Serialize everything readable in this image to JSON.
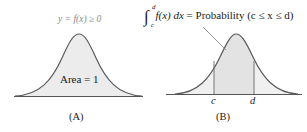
{
  "panel_a": {
    "title": "y = f(x) ≥ 0",
    "area_label": "Area = 1",
    "caption": "(A)"
  },
  "panel_b": {
    "integral_symbol": "∫",
    "upper_limit": "d",
    "lower_limit": "c",
    "integrand": "f(x) dx",
    "equals_text": "= Probability (c ≤ x ≤ d)",
    "c_label": "c",
    "d_label": "d",
    "caption": "(B)"
  },
  "colors": {
    "curve": "#5a5a5a",
    "fill_light": "#ececec",
    "fill_region": "#e2e2e2",
    "axis": "#555555"
  }
}
